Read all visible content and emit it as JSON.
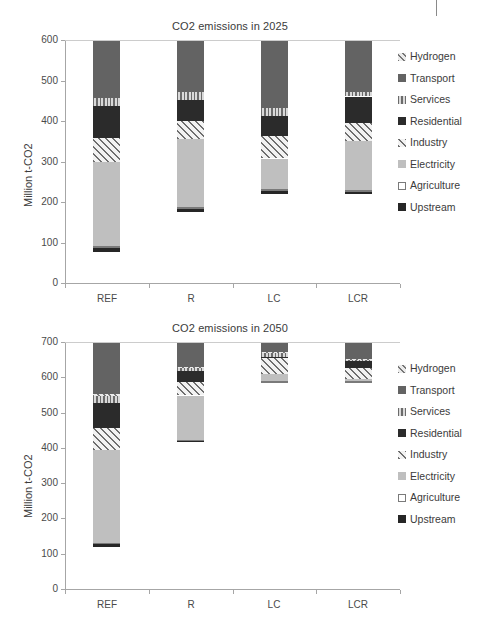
{
  "figure": {
    "ylabel": "Million t-CO2",
    "legend_entries": [
      {
        "label": "Hydrogen",
        "key": "hydrogen",
        "swatch": "hydrogen-swatch"
      },
      {
        "label": "Transport",
        "key": "transport",
        "swatch": "transport-swatch"
      },
      {
        "label": "Services",
        "key": "services",
        "swatch": "services-swatch"
      },
      {
        "label": "Residential",
        "key": "residential",
        "swatch": "residential-swatch"
      },
      {
        "label": "Industry",
        "key": "industry",
        "swatch": "industry-swatch"
      },
      {
        "label": "Electricity",
        "key": "electricity",
        "swatch": "electricity-swatch"
      },
      {
        "label": "Agriculture",
        "key": "agriculture",
        "swatch": "agriculture-swatch"
      },
      {
        "label": "Upstream",
        "key": "upstream",
        "swatch": "upstream-swatch"
      }
    ]
  },
  "chart_data": [
    {
      "type": "bar",
      "id": "co2-2025",
      "title": "CO2 emissions in 2025",
      "xlabel": "",
      "ylabel": "Million t-CO2",
      "ylim": [
        0,
        600
      ],
      "yticks": [
        0,
        100,
        200,
        300,
        400,
        500,
        600
      ],
      "ytick_labels": [
        "0",
        "100",
        "200",
        "300",
        "400",
        "500",
        "600"
      ],
      "grid": false,
      "stacked": true,
      "legend_position": "right",
      "categories": [
        "REF",
        "R",
        "LC",
        "LCR"
      ],
      "series": [
        {
          "name": "Upstream",
          "values": [
            12,
            9,
            12,
            8
          ]
        },
        {
          "name": "Agriculture",
          "values": [
            2,
            2,
            2,
            2
          ]
        },
        {
          "name": "Electricity",
          "values": [
            207,
            167,
            74,
            120
          ]
        },
        {
          "name": "Industry",
          "values": [
            59,
            44,
            55,
            45
          ]
        },
        {
          "name": "Residential",
          "values": [
            80,
            52,
            50,
            65
          ]
        },
        {
          "name": "Services",
          "values": [
            20,
            20,
            20,
            11
          ]
        },
        {
          "name": "Hydrogen",
          "values": [
            0,
            0,
            0,
            0
          ]
        },
        {
          "name": "Transport",
          "values": [
            143,
            129,
            168,
            129
          ]
        }
      ],
      "totals": [
        523,
        423,
        381,
        380
      ]
    },
    {
      "type": "bar",
      "id": "co2-2050",
      "title": "CO2 emissions in 2050",
      "xlabel": "",
      "ylabel": "Million t-CO2",
      "ylim": [
        0,
        700
      ],
      "yticks": [
        0,
        100,
        200,
        300,
        400,
        500,
        600,
        700
      ],
      "ytick_labels": [
        "0",
        "100",
        "200",
        "300",
        "400",
        "500",
        "600",
        "700"
      ],
      "grid": false,
      "stacked": true,
      "legend_position": "right",
      "categories": [
        "REF",
        "R",
        "LC",
        "LCR"
      ],
      "series": [
        {
          "name": "Upstream",
          "values": [
            12,
            7,
            3,
            3
          ]
        },
        {
          "name": "Agriculture",
          "values": [
            2,
            2,
            2,
            2
          ]
        },
        {
          "name": "Electricity",
          "values": [
            263,
            124,
            20,
            5
          ]
        },
        {
          "name": "Industry",
          "values": [
            62,
            38,
            45,
            32
          ]
        },
        {
          "name": "Residential",
          "values": [
            70,
            31,
            5,
            20
          ]
        },
        {
          "name": "Services",
          "values": [
            20,
            11,
            10,
            3
          ]
        },
        {
          "name": "Hydrogen",
          "values": [
            5,
            2,
            2,
            2
          ]
        },
        {
          "name": "Transport",
          "values": [
            148,
            70,
            29,
            49
          ]
        }
      ],
      "totals": [
        582,
        285,
        116,
        116
      ]
    }
  ]
}
